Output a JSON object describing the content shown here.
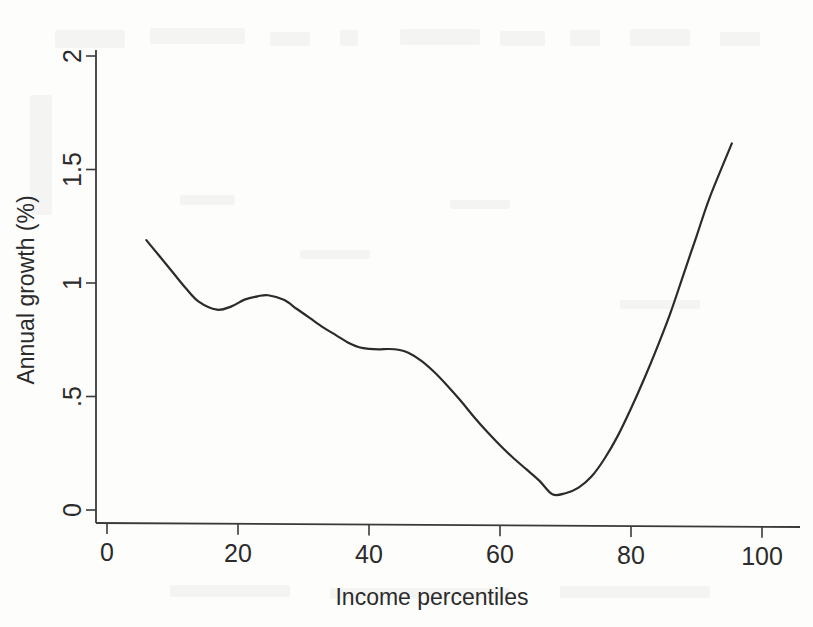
{
  "chart_data": {
    "type": "line",
    "title": "",
    "subtitle": "",
    "xlabel": "Income percentiles",
    "ylabel": "Annual growth (%)",
    "xlim": [
      0,
      100
    ],
    "ylim": [
      0,
      2
    ],
    "xticks": [
      0,
      20,
      40,
      60,
      80,
      100
    ],
    "xtick_labels": [
      "0",
      "20",
      "40",
      "60",
      "80",
      "100"
    ],
    "yticks": [
      0,
      0.5,
      1,
      1.5,
      2
    ],
    "ytick_labels": [
      "0",
      ".5",
      "1",
      "1.5",
      "2"
    ],
    "grid": false,
    "legend": null,
    "legend_position": "none",
    "line_color": "#2b2b2b",
    "line_width": 2.2,
    "series": [
      {
        "name": "Annual growth",
        "x": [
          6.0,
          8.0,
          10.0,
          12.0,
          14.0,
          16.8,
          19.0,
          21.0,
          23.0,
          24.6,
          27.0,
          29.0,
          31.0,
          33.0,
          35.0,
          37.0,
          38.5,
          40.0,
          41.5,
          43.0,
          44.5,
          46.0,
          48.0,
          50.0,
          52.0,
          54.0,
          56.0,
          58.0,
          60.0,
          62.0,
          64.0,
          66.0,
          68.0,
          70.0,
          72.0,
          74.0,
          76.0,
          78.0,
          80.0,
          82.0,
          84.0,
          86.0,
          88.0,
          90.0,
          92.0,
          95.4
        ],
        "y": [
          1.19,
          1.12,
          1.05,
          0.98,
          0.92,
          0.885,
          0.9,
          0.93,
          0.945,
          0.95,
          0.93,
          0.89,
          0.85,
          0.81,
          0.775,
          0.74,
          0.723,
          0.716,
          0.714,
          0.716,
          0.713,
          0.7,
          0.665,
          0.615,
          0.555,
          0.49,
          0.42,
          0.355,
          0.295,
          0.24,
          0.19,
          0.14,
          0.08,
          0.085,
          0.11,
          0.16,
          0.24,
          0.34,
          0.46,
          0.59,
          0.73,
          0.88,
          1.05,
          1.22,
          1.39,
          1.63
        ]
      }
    ],
    "annotations": [
      {
        "label": "local minimum",
        "x": 16.8,
        "y": 0.885
      },
      {
        "label": "local maximum",
        "x": 24.6,
        "y": 0.95
      },
      {
        "label": "plateau",
        "x": 41.5,
        "y": 0.714
      },
      {
        "label": "global minimum",
        "x": 68.0,
        "y": 0.08
      }
    ]
  }
}
